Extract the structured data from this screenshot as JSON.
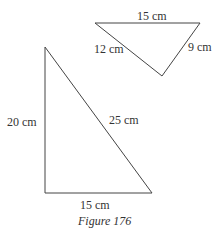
{
  "figure": {
    "caption": "Figure 176",
    "stroke_color": "#333333"
  },
  "triangles": [
    {
      "name": "small-triangle",
      "sides": {
        "top": "15 cm",
        "left": "12 cm",
        "right": "9 cm"
      }
    },
    {
      "name": "large-triangle",
      "sides": {
        "vertical": "20 cm",
        "hypotenuse": "25 cm",
        "base": "15 cm"
      }
    }
  ]
}
